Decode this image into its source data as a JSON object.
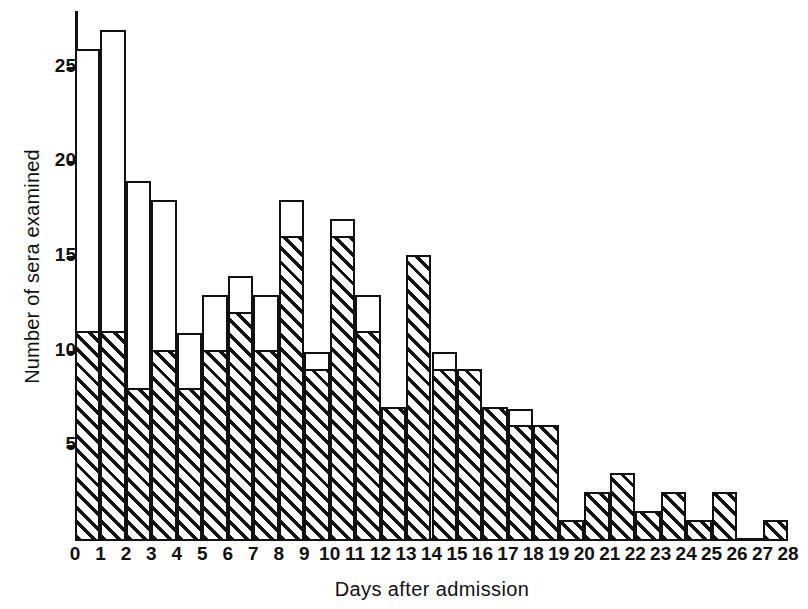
{
  "chart_data": {
    "type": "bar",
    "title": "",
    "subtitle": "",
    "xlabel": "Days after  admission",
    "ylabel": "Number of sera examined",
    "grid": false,
    "legend": null,
    "stacked": true,
    "bar_style": "stacked histogram, lower segment diagonally hatched, upper segment open/white",
    "categories": [
      0,
      1,
      2,
      3,
      4,
      5,
      6,
      7,
      8,
      9,
      10,
      11,
      12,
      13,
      14,
      15,
      16,
      17,
      18,
      19,
      20,
      21,
      22,
      23,
      24,
      25,
      26,
      27
    ],
    "x": [
      0,
      1,
      2,
      3,
      4,
      5,
      6,
      7,
      8,
      9,
      10,
      11,
      12,
      13,
      14,
      15,
      16,
      17,
      18,
      19,
      20,
      21,
      22,
      23,
      24,
      25,
      26,
      27
    ],
    "xlim": [
      0,
      28
    ],
    "ylim": [
      0,
      28
    ],
    "xticks": [
      0,
      1,
      2,
      3,
      4,
      5,
      6,
      7,
      8,
      9,
      10,
      11,
      12,
      13,
      14,
      15,
      16,
      17,
      18,
      19,
      20,
      21,
      22,
      23,
      24,
      25,
      26,
      27,
      28
    ],
    "xticklabels": [
      "0",
      "1",
      "2",
      "3",
      "4",
      "5",
      "6",
      "7",
      "8",
      "9",
      "10",
      "11",
      "12",
      "13",
      "14",
      "15",
      "16",
      "17",
      "18",
      "19",
      "20",
      "21",
      "22",
      "23",
      "24",
      "25",
      "26",
      "27",
      "28"
    ],
    "yticks": [
      5,
      10,
      15,
      20,
      25
    ],
    "yticklabels": [
      "5",
      "10",
      "15",
      "20",
      "25"
    ],
    "series": [
      {
        "name": "hatched",
        "values": [
          11,
          11,
          8,
          10,
          8,
          10,
          12,
          10,
          16,
          9,
          16,
          11,
          7,
          15,
          9,
          9,
          7,
          6,
          6,
          1,
          2.5,
          3.5,
          1.5,
          2.5,
          1,
          2.5,
          0,
          1
        ]
      },
      {
        "name": "open",
        "values": [
          15,
          16,
          11,
          8,
          3,
          3,
          2,
          3,
          2,
          1,
          1,
          2,
          0,
          0,
          1,
          0,
          0,
          1,
          0,
          0,
          0,
          0,
          0,
          0,
          0,
          0,
          0,
          0
        ]
      }
    ],
    "totals": [
      26,
      27,
      19,
      18,
      11,
      13,
      14,
      13,
      18,
      10,
      17,
      13,
      7,
      15,
      10,
      9,
      7,
      7,
      6,
      1,
      2.5,
      3.5,
      1.5,
      2.5,
      1,
      2.5,
      0,
      1
    ],
    "colors": {
      "ink": "#111111",
      "background": "#ffffff",
      "hatch": "#111111",
      "open_fill": "#ffffff"
    }
  }
}
